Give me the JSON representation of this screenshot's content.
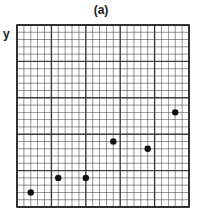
{
  "chart_data": {
    "type": "scatter",
    "title": "(a)",
    "xlabel": "",
    "ylabel": "y",
    "xlim": [
      0,
      25
    ],
    "ylim": [
      0,
      25
    ],
    "grid": true,
    "grid_major_every": 5,
    "grid_minor_every": 1,
    "tick_labels_shown": false,
    "marker_color": "#111111",
    "grid_color": "#333333",
    "points": [
      {
        "x": 2,
        "y": 2
      },
      {
        "x": 6,
        "y": 4
      },
      {
        "x": 10,
        "y": 4
      },
      {
        "x": 14,
        "y": 9
      },
      {
        "x": 19,
        "y": 8
      },
      {
        "x": 23,
        "y": 13
      }
    ]
  }
}
